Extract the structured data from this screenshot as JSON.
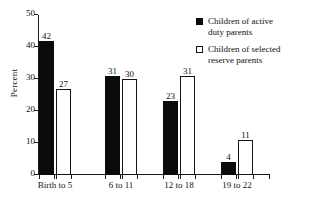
{
  "chart_data": {
    "type": "bar",
    "title": "",
    "xlabel": "",
    "ylabel": "Percent",
    "ylim": [
      0,
      50
    ],
    "yticks": [
      0,
      10,
      20,
      30,
      40,
      50
    ],
    "grid": false,
    "legend_position": "top-right",
    "categories": [
      "Birth to 5",
      "6 to 11",
      "12 to 18",
      "19 to 22"
    ],
    "series": [
      {
        "name": "Children of active duty parents",
        "name_line1": "Children of active",
        "name_line2": "duty parents",
        "style": "filled",
        "color": "#0b0b0b",
        "values": [
          42,
          31,
          23,
          4
        ]
      },
      {
        "name": "Children of selected reserve parents",
        "name_line1": "Children of selected",
        "name_line2": "reserve parents",
        "style": "hollow",
        "color": "#ffffff",
        "values": [
          27,
          30,
          31,
          11
        ]
      }
    ]
  }
}
